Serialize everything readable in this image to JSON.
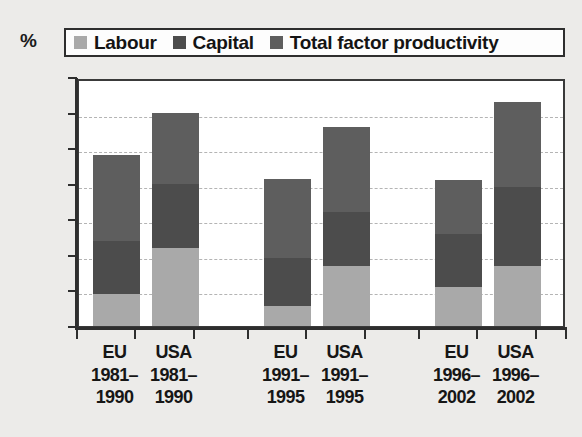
{
  "title": "",
  "unit_label": "%",
  "legend": {
    "items": [
      {
        "label": "Labour",
        "color": "#a9a9a9"
      },
      {
        "label": "Capital",
        "color": "#4c4c4c"
      },
      {
        "label": "Total factor productivity",
        "color": "#5e5e5e"
      }
    ]
  },
  "axis": {
    "y_ticks": [
      "0",
      "0.5",
      "1",
      "1.5",
      "2",
      "2.5",
      "3",
      "3.5"
    ],
    "x_labels": [
      {
        "region": "EU",
        "period_top": "1981–",
        "period_bottom": "1990"
      },
      {
        "region": "USA",
        "period_top": "1981–",
        "period_bottom": "1990"
      },
      {
        "region": "EU",
        "period_top": "1991–",
        "period_bottom": "1995"
      },
      {
        "region": "USA",
        "period_top": "1991–",
        "period_bottom": "1995"
      },
      {
        "region": "EU",
        "period_top": "1996–",
        "period_bottom": "2002"
      },
      {
        "region": "USA",
        "period_top": "1996–",
        "period_bottom": "2002"
      }
    ]
  },
  "chart_data": {
    "type": "bar",
    "stacked": true,
    "title": "",
    "xlabel": "",
    "ylabel": "%",
    "ylim": [
      0,
      3.5
    ],
    "ytick_step": 0.5,
    "grid": true,
    "legend_position": "top",
    "categories": [
      "EU 1981–1990",
      "USA 1981–1990",
      "EU 1991–1995",
      "USA 1991–1995",
      "EU 1996–2002",
      "USA 1996–2002"
    ],
    "series": [
      {
        "name": "Labour",
        "color": "#a9a9a9",
        "values": [
          0.45,
          1.1,
          0.28,
          0.85,
          0.55,
          0.85
        ]
      },
      {
        "name": "Capital",
        "color": "#4c4c4c",
        "values": [
          0.75,
          0.9,
          0.67,
          0.75,
          0.75,
          1.1
        ]
      },
      {
        "name": "Total factor productivity",
        "color": "#5e5e5e",
        "values": [
          1.2,
          1.0,
          1.12,
          1.2,
          0.75,
          1.2
        ]
      }
    ],
    "totals": [
      2.4,
      3.0,
      2.07,
      2.8,
      2.05,
      3.15
    ]
  }
}
